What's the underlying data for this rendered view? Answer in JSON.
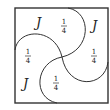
{
  "diagram": {
    "regions": [
      {
        "id": "top-left",
        "label": "J",
        "kind": "letter"
      },
      {
        "id": "top-mid",
        "label": {
          "numerator": "1",
          "denominator": "4"
        },
        "kind": "fraction"
      },
      {
        "id": "top-right",
        "label": "J",
        "kind": "letter"
      },
      {
        "id": "left",
        "label": {
          "numerator": "1",
          "denominator": "4"
        },
        "kind": "fraction"
      },
      {
        "id": "right",
        "label": {
          "numerator": "1",
          "denominator": "4"
        },
        "kind": "fraction"
      },
      {
        "id": "bottom-left",
        "label": "J",
        "kind": "letter"
      },
      {
        "id": "bottom-mid",
        "label": {
          "numerator": "1",
          "denominator": "4"
        },
        "kind": "fraction"
      }
    ],
    "stroke_color": "#333333"
  }
}
